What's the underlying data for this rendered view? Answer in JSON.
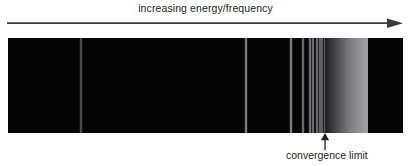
{
  "figure": {
    "type": "emission-spectrum-diagram",
    "axis_label": "increasing energy/frequency",
    "convergence_label": "convergence limit",
    "background_color": "#ffffff",
    "text_color": "#231f20",
    "band": {
      "background_color": "#050505",
      "x": 8,
      "y": 38,
      "width": 395,
      "height": 95
    },
    "arrow": {
      "direction": "right",
      "color": "#3a3a3c",
      "x_start": 7,
      "x_end": 403
    },
    "pointer": {
      "direction": "up",
      "color": "#231f20",
      "x": 324,
      "y_top": 133,
      "y_bottom": 150
    }
  },
  "chart_data": {
    "type": "spectrum",
    "title": "increasing energy/frequency",
    "xlabel": "increasing energy/frequency",
    "ylabel": "",
    "grid": false,
    "legend": null,
    "annotations": [
      {
        "text": "increasing energy/frequency",
        "x": 205,
        "y": 10
      },
      {
        "text": "convergence limit",
        "x": 324,
        "y": 157
      }
    ],
    "lines": [
      {
        "x": 81,
        "width": 1.6,
        "brightness": "#4a4a4d"
      },
      {
        "x": 246,
        "width": 1.6,
        "brightness": "#7a7a7d"
      },
      {
        "x": 291,
        "width": 1.6,
        "brightness": "#7a7a7d"
      },
      {
        "x": 303,
        "width": 1.6,
        "brightness": "#6a6a6d"
      },
      {
        "x": 310,
        "width": 1.4,
        "brightness": "#6f6f72"
      },
      {
        "x": 313,
        "width": 1.3,
        "brightness": "#6a6a6d"
      },
      {
        "x": 317,
        "width": 1.3,
        "brightness": "#68686b"
      },
      {
        "x": 320,
        "width": 1.2,
        "brightness": "#636366"
      },
      {
        "x": 322,
        "width": 1.1,
        "brightness": "#5e5e61"
      },
      {
        "x": 324,
        "width": 1.0,
        "brightness": "#59595c"
      }
    ],
    "continuum": {
      "x_start": 325,
      "x_end": 368,
      "start_color": "#1a1a1c",
      "peak_color": "#9d9da0",
      "end_color": "#050505",
      "description": "ionisation continuum above convergence limit"
    }
  }
}
